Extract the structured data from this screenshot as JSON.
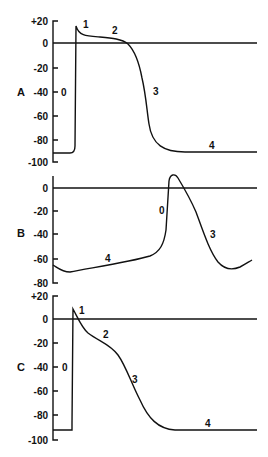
{
  "figure": {
    "panels": [
      {
        "label": "A",
        "y_ticks": [
          "+20",
          "0",
          "-20",
          "-40",
          "-60",
          "-80",
          "-100"
        ],
        "phase_labels": [
          "0",
          "1",
          "2",
          "3",
          "4"
        ]
      },
      {
        "label": "B",
        "y_ticks": [
          "0",
          "-20",
          "-40",
          "-60",
          "-80"
        ],
        "phase_labels": [
          "0",
          "3",
          "4"
        ]
      },
      {
        "label": "C",
        "y_ticks": [
          "+20",
          "0",
          "-20",
          "-40",
          "-60",
          "-80",
          "-100"
        ],
        "phase_labels": [
          "0",
          "1",
          "2",
          "3",
          "4"
        ]
      }
    ]
  },
  "colors": {
    "ink": "#111111",
    "background": "#ffffff"
  }
}
